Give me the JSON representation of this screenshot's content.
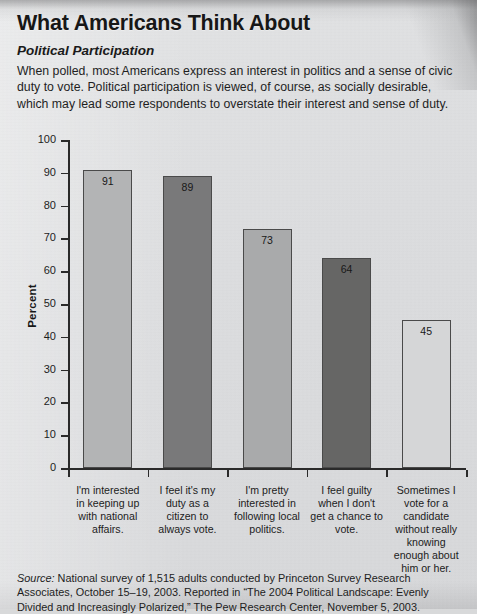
{
  "header": {
    "title": "What Americans Think About",
    "subtitle": "Political Participation",
    "intro": "When polled, most Americans express an interest in politics and a sense of civic duty to vote. Political participation is viewed, of course, as socially desirable, which may lead some respondents to overstate their interest and sense of duty."
  },
  "chart_data": {
    "type": "bar",
    "title": "What Americans Think About Political Participation",
    "xlabel": "",
    "ylabel": "Percent",
    "ylim": [
      0,
      100
    ],
    "ytick_labels": [
      "0",
      "10",
      "20",
      "30",
      "40",
      "50",
      "60",
      "70",
      "80",
      "90",
      "100"
    ],
    "yticks": [
      0,
      10,
      20,
      30,
      40,
      50,
      60,
      70,
      80,
      90,
      100
    ],
    "grid": false,
    "legend": "none",
    "categories": [
      "I'm interested in keeping up with national affairs.",
      "I feel it's my duty as a citizen to always vote.",
      "I'm pretty interested in following local politics.",
      "I feel guilty when I don't get a chance to vote.",
      "Sometimes I vote for a candidate without really knowing enough about him or her."
    ],
    "values": [
      91,
      89,
      73,
      64,
      45
    ],
    "value_labels": [
      "91",
      "89",
      "73",
      "64",
      "45"
    ],
    "bar_colors": [
      "#b3b4b5",
      "#79797a",
      "#a9aaab",
      "#666665",
      "#d5d6d7"
    ],
    "bar_edge_color": "#4a4a4a"
  },
  "footer": {
    "source_label": "Source:",
    "source_text": " National survey of 1,515 adults conducted by Princeton Survey Research Associates, October 15–19, 2003. Reported in “The 2004 Political Landscape: Evenly Divided and Increasingly Polarized,” The Pew Research Center, November 5, 2003."
  }
}
